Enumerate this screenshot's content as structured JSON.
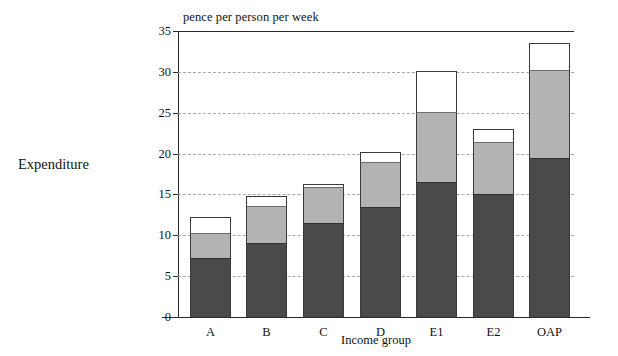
{
  "chart_data": {
    "type": "bar",
    "subtype": "stacked-vertical",
    "title": "",
    "y_unit_label": "pence per person per week",
    "ylabel": "Expenditure",
    "xlabel": "Income group",
    "categories": [
      "A",
      "B",
      "C",
      "D",
      "E1",
      "E2",
      "OAP"
    ],
    "series": [
      {
        "name": "lower (dark)",
        "color": "#4a4a4a",
        "values": [
          7.2,
          9.0,
          11.5,
          13.5,
          16.5,
          15.1,
          19.5
        ]
      },
      {
        "name": "middle (grey)",
        "color": "#b3b3b3",
        "values": [
          3.1,
          4.6,
          4.4,
          5.5,
          8.6,
          6.3,
          10.7
        ]
      },
      {
        "name": "upper (white)",
        "color": "#ffffff",
        "values": [
          1.9,
          1.2,
          0.4,
          1.2,
          5.0,
          1.6,
          3.3
        ]
      }
    ],
    "totals": [
      12.2,
      14.8,
      16.3,
      20.2,
      30.1,
      23.0,
      33.5
    ],
    "ylim": [
      0,
      35
    ],
    "yticks": [
      0,
      5,
      10,
      15,
      20,
      25,
      30,
      35
    ],
    "ytick_labels": [
      "0",
      "5",
      "10",
      "15",
      "20",
      "25",
      "30",
      "35"
    ],
    "grid": true,
    "grid_style": "dashed-horizontal",
    "legend": "none"
  }
}
